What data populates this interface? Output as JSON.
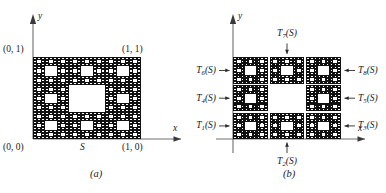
{
  "figure": {
    "background": "#ffffff",
    "ink": "#1a1a1a",
    "axis_color": "#6e6e6e",
    "carpet_fill": "#111111",
    "carpet_hole": "#ffffff"
  },
  "panel_a": {
    "caption": "(a)",
    "axis_x_label": "x",
    "axis_y_label": "y",
    "corner_origin": "(0, 0)",
    "corner_top_left": "(0, 1)",
    "corner_top_right": "(1, 1)",
    "corner_bottom_right": "(1, 0)",
    "set_label": "S",
    "carpet_depth": 4
  },
  "panel_b": {
    "caption": "(b)",
    "axis_x_label": "x",
    "axis_y_label": "y",
    "carpet_depth": 3,
    "maps": [
      {
        "id": "T1",
        "base": "T",
        "sub": "1",
        "suffix": "(S)",
        "label": "T1(S)",
        "side": "left",
        "row": 0,
        "col": 0
      },
      {
        "id": "T2",
        "base": "T",
        "sub": "2",
        "suffix": "(S)",
        "label": "T2(S)",
        "side": "bottom",
        "row": 0,
        "col": 1
      },
      {
        "id": "T3",
        "base": "T",
        "sub": "3",
        "suffix": "(S)",
        "label": "T3(S)",
        "side": "right",
        "row": 0,
        "col": 2
      },
      {
        "id": "T4",
        "base": "T",
        "sub": "4",
        "suffix": "(S)",
        "label": "T4(S)",
        "side": "left",
        "row": 1,
        "col": 0
      },
      {
        "id": "T5",
        "base": "T",
        "sub": "5",
        "suffix": "(S)",
        "label": "T5(S)",
        "side": "right",
        "row": 1,
        "col": 2
      },
      {
        "id": "T6",
        "base": "T",
        "sub": "6",
        "suffix": "(S)",
        "label": "T6(S)",
        "side": "left",
        "row": 2,
        "col": 0
      },
      {
        "id": "T7",
        "base": "T",
        "sub": "7",
        "suffix": "(S)",
        "label": "T7(S)",
        "side": "top",
        "row": 2,
        "col": 1
      },
      {
        "id": "T8",
        "base": "T",
        "sub": "8",
        "suffix": "(S)",
        "label": "T8(S)",
        "side": "right",
        "row": 2,
        "col": 2
      }
    ]
  },
  "chart_data": {
    "type": "diagram",
    "panels": [
      "(a)",
      "(b)"
    ],
    "unit_square": {
      "x": [
        0,
        1
      ],
      "y": [
        0,
        1
      ]
    },
    "labelled_points": [
      {
        "label": "(0, 0)",
        "x": 0,
        "y": 0
      },
      {
        "label": "(0, 1)",
        "x": 0,
        "y": 1
      },
      {
        "label": "(1, 1)",
        "x": 1,
        "y": 1
      },
      {
        "label": "(1, 0)",
        "x": 1,
        "y": 0
      }
    ],
    "subcopies": 8,
    "omitted_cell": {
      "row": 1,
      "col": 1
    }
  }
}
